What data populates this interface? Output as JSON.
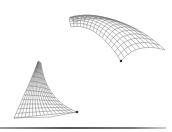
{
  "figure": {
    "surfaces": [
      {
        "name": "vault-shell",
        "position": "upper-right",
        "type": "curved barrel vault mesh",
        "corner_node": [
          121,
          61
        ],
        "stroke_color": "#6e6e6e"
      },
      {
        "name": "cone-shell",
        "position": "lower-left",
        "type": "curved triangular / conoid mesh",
        "apex": [
          38,
          63
        ],
        "corner_node": [
          77,
          112
        ],
        "stroke_color": "#6e6e6e"
      }
    ],
    "rule_color": "#555555"
  }
}
